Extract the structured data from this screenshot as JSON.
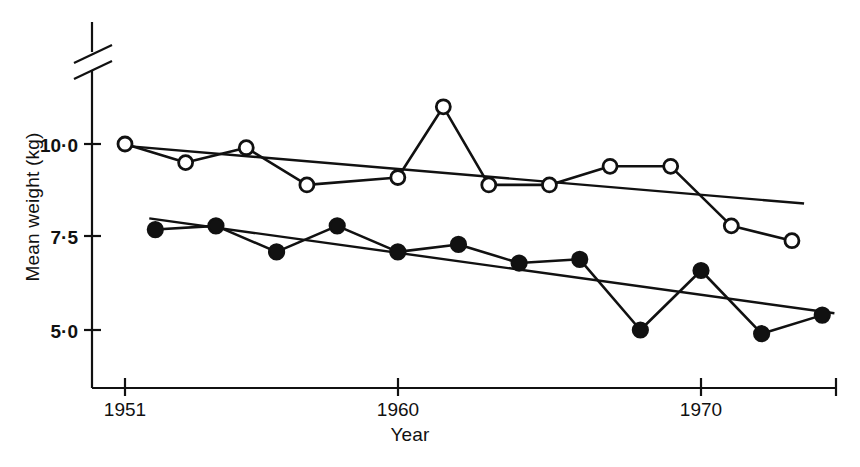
{
  "chart_data": {
    "type": "line",
    "title": "",
    "xlabel": "Year",
    "ylabel": "Mean weight (kg)",
    "xlim": [
      1950.0,
      1974.4
    ],
    "ylim": [
      4.1,
      11.6
    ],
    "grid": false,
    "legend": "none",
    "axis_break": true,
    "yticks": [
      5.0,
      7.5,
      10.0
    ],
    "ytick_labels": [
      "5·0",
      "7·5",
      "10·0"
    ],
    "xticks": [
      1951,
      1960,
      1970
    ],
    "xtick_labels": [
      "1951",
      "1960",
      "1970"
    ],
    "series": [
      {
        "name": "open-circles",
        "marker": "open-circle",
        "color": "#111111",
        "x": [
          1951,
          1953,
          1955,
          1957,
          1960,
          1961.5,
          1963,
          1965,
          1967,
          1969,
          1971,
          1973
        ],
        "values": [
          10.0,
          9.5,
          9.9,
          8.9,
          9.1,
          11.0,
          8.9,
          8.9,
          9.4,
          9.4,
          7.8,
          7.4
        ],
        "trend": {
          "x": [
            1951,
            1973.4
          ],
          "y": [
            9.95,
            8.4
          ]
        }
      },
      {
        "name": "filled-circles",
        "marker": "filled-circle",
        "color": "#111111",
        "x": [
          1952,
          1954,
          1956,
          1958,
          1960,
          1962,
          1964,
          1966,
          1968,
          1970,
          1972,
          1974
        ],
        "values": [
          7.7,
          7.8,
          7.1,
          7.8,
          7.1,
          7.3,
          6.8,
          6.9,
          5.0,
          6.6,
          4.9,
          5.4
        ],
        "trend": {
          "x": [
            1951.8,
            1974.4
          ],
          "y": [
            8.0,
            5.45
          ]
        }
      }
    ]
  },
  "labels": {
    "ylabel": "Mean weight (kg)",
    "xlabel": "Year"
  }
}
